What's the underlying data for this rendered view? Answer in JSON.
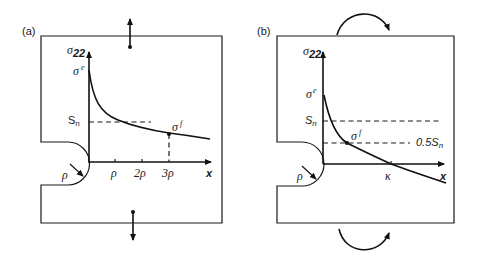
{
  "figure": {
    "panel_a": {
      "label": "(a)",
      "y_axis_label": "σ",
      "y_axis_sub": "22",
      "peak_label": "σ",
      "peak_sup": "e",
      "sn_label": "S",
      "sn_sub": "n",
      "point_label": "σ",
      "point_sup": "f",
      "x_axis_label": "x",
      "notch_radius_label": "ρ",
      "ticks": [
        "ρ",
        "2ρ",
        "3ρ"
      ],
      "loading": "tension (opposed vertical arrows)"
    },
    "panel_b": {
      "label": "(b)",
      "y_axis_label": "σ",
      "y_axis_sub": "22",
      "peak_label": "σ",
      "peak_sup": "e",
      "sn_label": "S",
      "sn_sub": "n",
      "half_sn_label": "0.5S",
      "half_sn_sub": "n",
      "point_label": "σ",
      "point_sup": "f",
      "x_axis_label": "x",
      "notch_radius_label": "ρ",
      "crossing_label": "κ",
      "loading": "bending (curved moment arrows)"
    }
  }
}
